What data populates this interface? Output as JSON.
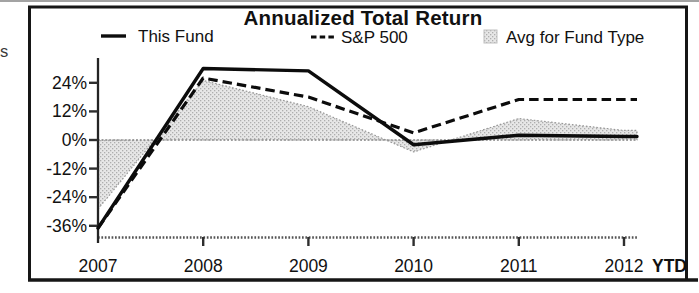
{
  "page": {
    "edge_text_fragment": "s"
  },
  "chart_data": {
    "type": "line",
    "title": "Annualized Total Return",
    "categories": [
      "2007",
      "2008",
      "2009",
      "2010",
      "2011",
      "2012"
    ],
    "x_axis_suffix": "YTD",
    "unit": "%",
    "ylim": [
      -40,
      33
    ],
    "grid": "zero-line-only",
    "legend_position": "top",
    "series": [
      {
        "name": "This Fund",
        "style": "solid-line",
        "color": "#0c0c0c",
        "values": [
          -37,
          30,
          29,
          -2,
          2,
          1.5
        ]
      },
      {
        "name": "S&P 500",
        "style": "dashed-line",
        "color": "#0c0c0c",
        "values": [
          -37,
          26,
          18,
          3,
          17,
          17
        ]
      },
      {
        "name": "Avg for Fund Type",
        "style": "shaded-area",
        "color": "#d9d9d9",
        "values": [
          -29,
          25,
          14,
          -5,
          9,
          4
        ]
      }
    ],
    "y_ticks": [
      {
        "label": "24%",
        "value": 24
      },
      {
        "label": "12%",
        "value": 12
      },
      {
        "label": "0%",
        "value": 0
      },
      {
        "label": "-12%",
        "value": -12
      },
      {
        "label": "-24%",
        "value": -24
      },
      {
        "label": "-36%",
        "value": -36
      }
    ]
  }
}
